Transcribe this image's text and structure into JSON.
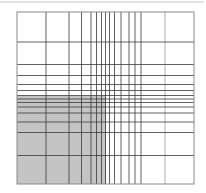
{
  "diagram": {
    "width": 206,
    "height": 193,
    "top_rule": {
      "y": 2,
      "x1": 0,
      "x2": 204,
      "color": "#c8c8c8"
    },
    "frame": {
      "x": 17,
      "y": 12,
      "width": 177,
      "height": 172,
      "color": "#8a8a8a"
    },
    "shaded_region": {
      "x": 17,
      "y": 96,
      "width": 89,
      "height": 88,
      "color": "#c4c4c4"
    },
    "vertical_lines_x": [
      46,
      69,
      81.5,
      91,
      96.5,
      101.5,
      105.5,
      109.5,
      114.5,
      121,
      129,
      135,
      141,
      165
    ],
    "horizontal_lines_y": [
      42,
      64.5,
      75.5,
      84.5,
      90.5,
      95.5,
      99,
      102.5,
      107,
      113,
      122,
      132.5,
      155.5
    ],
    "line_color": "#3a3a3a",
    "light_line_color": "#9a9a9a"
  }
}
